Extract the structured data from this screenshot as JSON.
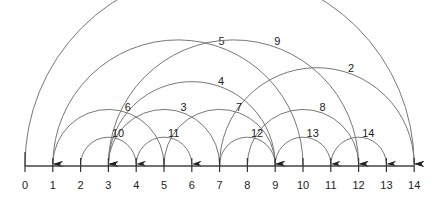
{
  "diagram": {
    "type": "arc-diagram",
    "axis_labels": [
      "0",
      "1",
      "2",
      "3",
      "4",
      "5",
      "6",
      "7",
      "8",
      "9",
      "10",
      "11",
      "12",
      "13",
      "14"
    ],
    "arcs": [
      {
        "label": "1",
        "from": 0,
        "to": 14
      },
      {
        "label": "2",
        "from": 7,
        "to": 14
      },
      {
        "label": "3",
        "from": 7,
        "to": 3
      },
      {
        "label": "4",
        "from": 9,
        "to": 3
      },
      {
        "label": "5",
        "from": 10,
        "to": 1
      },
      {
        "label": "6",
        "from": 5,
        "to": 1
      },
      {
        "label": "7",
        "from": 5,
        "to": 9
      },
      {
        "label": "8",
        "from": 8,
        "to": 12
      },
      {
        "label": "9",
        "from": 3,
        "to": 12
      },
      {
        "label": "10",
        "from": 2,
        "to": 4
      },
      {
        "label": "11",
        "from": 4,
        "to": 6
      },
      {
        "label": "12",
        "from": 7,
        "to": 9
      },
      {
        "label": "13",
        "from": 9,
        "to": 11
      },
      {
        "label": "14",
        "from": 11,
        "to": 13
      }
    ]
  }
}
